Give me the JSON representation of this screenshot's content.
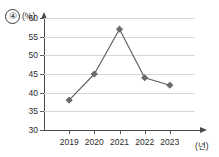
{
  "choice": {
    "number": "④"
  },
  "chart_data": {
    "type": "line",
    "title": "",
    "xlabel": "(년)",
    "ylabel": "(%)",
    "categories": [
      "2019",
      "2020",
      "2021",
      "2022",
      "2023"
    ],
    "values": [
      38,
      45,
      57,
      44,
      42
    ],
    "series": [
      {
        "name": "",
        "values": [
          38,
          45,
          57,
          44,
          42
        ]
      }
    ],
    "ylim": [
      30,
      60
    ],
    "ytick_step": 5,
    "yticks": [
      30,
      35,
      40,
      45,
      50,
      55,
      60
    ],
    "grid": true,
    "legend": "none",
    "marker": "diamond",
    "line_color": "#5a5a5a",
    "marker_color": "#6b6b6b",
    "grid_color": "#d8d8d8",
    "axis_color": "#4a4a4a"
  }
}
